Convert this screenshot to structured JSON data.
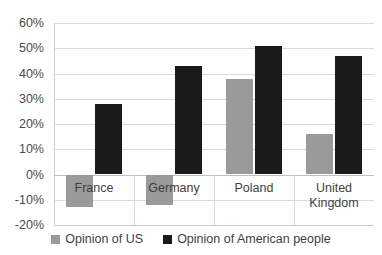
{
  "chart_data": {
    "type": "bar",
    "title": "",
    "subtitle": "",
    "xlabel": "",
    "ylabel": "",
    "categories": [
      "France",
      "Germany",
      "Poland",
      "United\nKingdom"
    ],
    "series": [
      {
        "name": "Opinion of US",
        "color": "#9a9a9a",
        "values": [
          -13,
          -12,
          38,
          16
        ]
      },
      {
        "name": "Opinion of American people",
        "color": "#1a1a1a",
        "values": [
          28,
          43,
          51,
          47
        ]
      }
    ],
    "ylim": [
      -20,
      60
    ],
    "ytick_step": 10,
    "ytick_labels": [
      "60%",
      "50%",
      "40%",
      "30%",
      "20%",
      "10%",
      "0%",
      "-10%",
      "-20%"
    ],
    "ytick_values": [
      60,
      50,
      40,
      30,
      20,
      10,
      0,
      -10,
      -20
    ],
    "grid": true,
    "legend_position": "bottom",
    "value_suffix": "%"
  }
}
